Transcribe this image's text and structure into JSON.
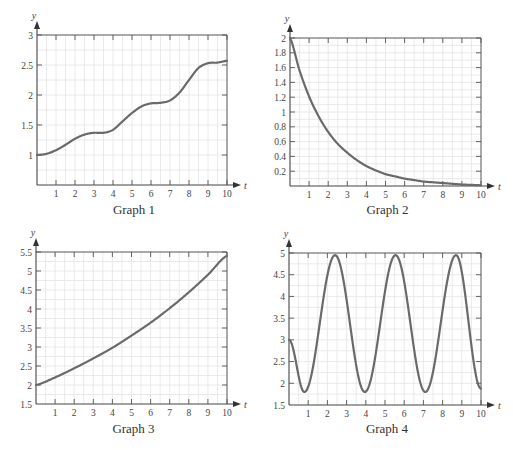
{
  "chart_data": [
    {
      "id": "graph1",
      "type": "line",
      "title": "Graph 1",
      "xlabel": "t",
      "ylabel": "y",
      "xlim": [
        0,
        10
      ],
      "ylim": [
        0.5,
        3
      ],
      "xticks": [
        1,
        2,
        3,
        4,
        5,
        6,
        7,
        8,
        9,
        10
      ],
      "yticks": [
        1,
        1.5,
        2,
        2.5,
        3
      ],
      "ytick_labels": [
        "1",
        "1.5",
        "2",
        "2.5",
        "3"
      ],
      "grid": true,
      "x": [
        0,
        0.5,
        1,
        1.5,
        2,
        2.5,
        3,
        3.5,
        4,
        4.5,
        5,
        5.5,
        6,
        6.5,
        7,
        7.5,
        8,
        8.5,
        9,
        9.5,
        10
      ],
      "values": [
        1.0,
        1.02,
        1.08,
        1.17,
        1.27,
        1.34,
        1.37,
        1.37,
        1.42,
        1.56,
        1.7,
        1.81,
        1.86,
        1.87,
        1.91,
        2.04,
        2.25,
        2.45,
        2.53,
        2.54,
        2.57
      ]
    },
    {
      "id": "graph2",
      "type": "line",
      "title": "Graph 2",
      "xlabel": "t",
      "ylabel": "y",
      "xlim": [
        0,
        10
      ],
      "ylim": [
        0,
        2
      ],
      "xticks": [
        1,
        2,
        3,
        4,
        5,
        6,
        7,
        8,
        9,
        10
      ],
      "yticks": [
        0.2,
        0.4,
        0.6,
        0.8,
        1,
        1.2,
        1.4,
        1.6,
        1.8,
        2
      ],
      "ytick_labels": [
        "0.2",
        "0.4",
        "0.6",
        "0.8",
        "1",
        "1.2",
        "1.4",
        "1.6",
        "1.8",
        "2"
      ],
      "grid": true,
      "x": [
        0,
        0.5,
        1,
        1.5,
        2,
        2.5,
        3,
        3.5,
        4,
        4.5,
        5,
        5.5,
        6,
        6.5,
        7,
        7.5,
        8,
        8.5,
        9,
        9.5,
        10
      ],
      "values": [
        2.0,
        1.56,
        1.21,
        0.94,
        0.73,
        0.57,
        0.45,
        0.35,
        0.27,
        0.21,
        0.16,
        0.13,
        0.1,
        0.08,
        0.06,
        0.05,
        0.04,
        0.03,
        0.02,
        0.015,
        0.01
      ]
    },
    {
      "id": "graph3",
      "type": "line",
      "title": "Graph 3",
      "xlabel": "t",
      "ylabel": "y",
      "xlim": [
        0,
        10
      ],
      "ylim": [
        1.5,
        5.5
      ],
      "xticks": [
        1,
        2,
        3,
        4,
        5,
        6,
        7,
        8,
        9,
        10
      ],
      "yticks": [
        1.5,
        2,
        2.5,
        3,
        3.5,
        4,
        4.5,
        5,
        5.5
      ],
      "ytick_labels": [
        "1.5",
        "2",
        "2.5",
        "3",
        "3.5",
        "4",
        "4.5",
        "5",
        "5.5"
      ],
      "grid": true,
      "x": [
        0,
        1,
        2,
        3,
        4,
        5,
        6,
        7,
        8,
        9,
        10
      ],
      "values": [
        2.0,
        2.2,
        2.44,
        2.7,
        2.98,
        3.3,
        3.64,
        4.02,
        4.44,
        4.9,
        5.4
      ]
    },
    {
      "id": "graph4",
      "type": "line",
      "title": "Graph 4",
      "xlabel": "t",
      "ylabel": "y",
      "xlim": [
        0,
        10
      ],
      "ylim": [
        1.5,
        5
      ],
      "xticks": [
        1,
        2,
        3,
        4,
        5,
        6,
        7,
        8,
        9,
        10
      ],
      "yticks": [
        1.5,
        2,
        2.5,
        3,
        3.5,
        4,
        4.5,
        5
      ],
      "ytick_labels": [
        "1.5",
        "2",
        "2.5",
        "3",
        "3.5",
        "4",
        "4.5",
        "5"
      ],
      "grid": true,
      "description": "periodic oscillation, minima ~1.8 at t≈0.8, 3.9, 7.0; maxima ~4.95 at t≈2.4, 5.5, 8.7; starts at y=3",
      "x": [
        0,
        0.8,
        2.4,
        3.95,
        5.55,
        7.1,
        8.7,
        10
      ],
      "values": [
        3.0,
        1.8,
        4.95,
        1.8,
        4.95,
        1.8,
        4.95,
        1.88
      ]
    }
  ],
  "captions": [
    "Graph 1",
    "Graph 2",
    "Graph 3",
    "Graph 4"
  ],
  "axis_labels": {
    "x": "t",
    "y": "y"
  },
  "colors": {
    "curve": "#6a6a6a",
    "grid": "#e4e4e4",
    "axis": "#444444"
  }
}
